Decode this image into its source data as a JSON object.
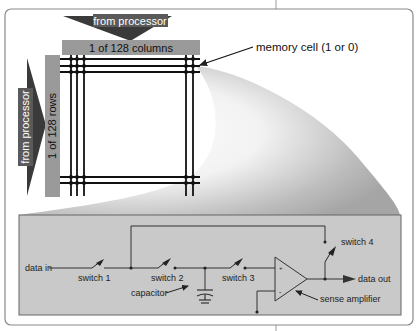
{
  "memory_array": {
    "column_arrow_label": "from processor",
    "row_arrow_label": "from processor",
    "column_bar_label": "1 of 128 columns",
    "row_bar_label": "1 of 128 rows",
    "cell_callout": "memory cell (1 or 0)"
  },
  "circuit": {
    "data_in": "data in",
    "switch1": "switch 1",
    "switch2": "switch 2",
    "switch3": "switch 3",
    "switch4": "switch 4",
    "capacitor": "capacitor",
    "sense_amplifier": "sense amplifier",
    "data_out": "data out",
    "plus": "+",
    "minus": "-"
  },
  "colors": {
    "arrow_dark": "#3a3a3a",
    "bar_grey": "#9a9a9a",
    "circuit_bg": "#c9c9c9",
    "frame": "#8a8a8a",
    "wire": "#333333"
  }
}
